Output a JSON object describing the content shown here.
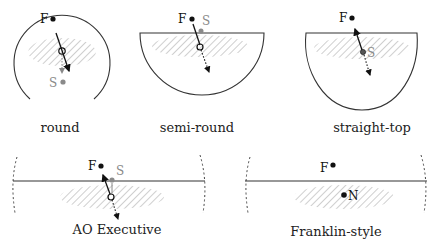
{
  "colors": {
    "outline": "#333333",
    "black_point": "#111111",
    "gray_point": "#8a8a8a",
    "hatch": "#b5b5b5",
    "label": "#222222"
  },
  "panels": [
    {
      "id": "round",
      "label": "round",
      "points": [
        {
          "name": "F",
          "color": "black"
        },
        {
          "name": "S",
          "color": "gray"
        }
      ]
    },
    {
      "id": "semi-round",
      "label": "semi-round",
      "points": [
        {
          "name": "F",
          "color": "black"
        },
        {
          "name": "S",
          "color": "gray"
        }
      ]
    },
    {
      "id": "straight-top",
      "label": "straight-top",
      "points": [
        {
          "name": "F",
          "color": "black"
        },
        {
          "name": "S",
          "color": "gray"
        }
      ]
    },
    {
      "id": "ao-executive",
      "label": "AO Executive",
      "points": [
        {
          "name": "F",
          "color": "black"
        },
        {
          "name": "S",
          "color": "gray"
        }
      ]
    },
    {
      "id": "franklin-style",
      "label": "Franklin-style",
      "points": [
        {
          "name": "F",
          "color": "black"
        },
        {
          "name": "N",
          "color": "black"
        }
      ]
    }
  ]
}
